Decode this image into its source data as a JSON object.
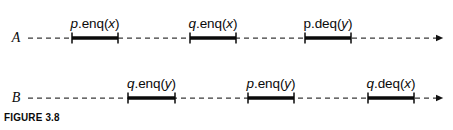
{
  "figure": {
    "caption": "FIGURE 3.8",
    "width": 453,
    "height": 130,
    "colors": {
      "ink": "#0a0a0a",
      "background": "#ffffff",
      "dashed_axis": "#3a3a3a"
    }
  },
  "lanes": [
    {
      "name": "A",
      "label_x": 16,
      "axis_y": 38,
      "axis_start_x": 28,
      "axis_end_x": 437,
      "label_y": 38,
      "intervals": [
        {
          "label_proc": "p",
          "label_proc_style": "italic",
          "label_op": ".enq(",
          "label_var": "x",
          "label_close": ")",
          "label_text": "p.enq(x)",
          "start_x": 72,
          "end_x": 118,
          "label_y": 16
        },
        {
          "label_proc": "q",
          "label_proc_style": "italic",
          "label_op": ".enq(",
          "label_var": "x",
          "label_close": ")",
          "label_text": "q.enq(x)",
          "start_x": 190,
          "end_x": 236,
          "label_y": 16
        },
        {
          "label_proc": "p",
          "label_proc_style": "roman",
          "label_op": ".deq(",
          "label_var": "y",
          "label_close": ")",
          "label_text": "p.deq(y)",
          "start_x": 305,
          "end_x": 351,
          "label_y": 16
        }
      ]
    },
    {
      "name": "B",
      "label_x": 16,
      "axis_y": 98,
      "axis_start_x": 28,
      "axis_end_x": 437,
      "label_y": 98,
      "intervals": [
        {
          "label_proc": "q",
          "label_proc_style": "italic",
          "label_op": ".enq(",
          "label_var": "y",
          "label_close": ")",
          "label_text": "q.enq(y)",
          "start_x": 128,
          "end_x": 175,
          "label_y": 76
        },
        {
          "label_proc": "p",
          "label_proc_style": "italic",
          "label_op": ".enq(",
          "label_var": "y",
          "label_close": ")",
          "label_text": "p.enq(y)",
          "start_x": 248,
          "end_x": 294,
          "label_y": 76
        },
        {
          "label_proc": "q",
          "label_proc_style": "italic",
          "label_op": ".deq(",
          "label_var": "x",
          "label_close": ")",
          "label_text": "q.deq(x)",
          "start_x": 368,
          "end_x": 414,
          "label_y": 76
        }
      ]
    }
  ]
}
